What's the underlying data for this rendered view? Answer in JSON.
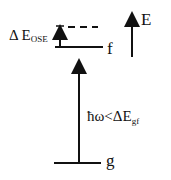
{
  "diagram": {
    "colors": {
      "line": "#111111",
      "background": "#ffffff"
    },
    "levels": [
      {
        "id": "f",
        "label": "f",
        "y": 47,
        "x1": 55,
        "x2": 103,
        "style": "solid"
      },
      {
        "id": "f_shifted",
        "label": "",
        "y": 27,
        "x1": 68,
        "x2": 98,
        "style": "dashed"
      },
      {
        "id": "g",
        "label": "g",
        "y": 163,
        "x1": 54,
        "x2": 101,
        "style": "solid"
      }
    ],
    "arrows": [
      {
        "id": "ose-shift",
        "from_y": 47,
        "to_y": 28,
        "x": 60
      },
      {
        "id": "photon",
        "from_y": 163,
        "to_y": 62,
        "x": 79
      },
      {
        "id": "energy-axis",
        "from_y": 57,
        "to_y": 15,
        "x": 132
      }
    ],
    "labels": {
      "delta_e_ose_main": "Δ E",
      "delta_e_ose_sub": "OSE",
      "level_f": "f",
      "level_g": "g",
      "energy_axis": "E",
      "photon_main": "ħω<ΔE",
      "photon_sub": "gf"
    }
  }
}
